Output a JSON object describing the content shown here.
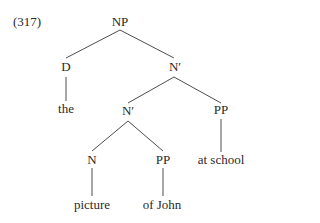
{
  "example_number": "(317)",
  "tree": {
    "nodes": {
      "np": "NP",
      "d": "D",
      "nbar_top": "N′",
      "the": "the",
      "nbar_mid": "N′",
      "pp_right": "PP",
      "n": "N",
      "pp_mid": "PP",
      "at_school": "at school",
      "picture": "picture",
      "of_john": "of John"
    },
    "edges": [
      [
        "NP",
        "D"
      ],
      [
        "NP",
        "N′"
      ],
      [
        "D",
        "the"
      ],
      [
        "N′",
        "N′"
      ],
      [
        "N′",
        "PP"
      ],
      [
        "PP",
        "at school"
      ],
      [
        "N′",
        "N"
      ],
      [
        "N′",
        "PP"
      ],
      [
        "N",
        "picture"
      ],
      [
        "PP",
        "of John"
      ]
    ]
  }
}
